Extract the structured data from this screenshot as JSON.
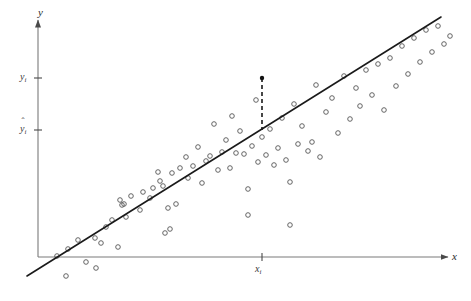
{
  "figure": {
    "type": "scatter-regression-diagram",
    "background_color": "#ffffff",
    "width": 471,
    "height": 301
  },
  "axes": {
    "x_axis_name": "x",
    "y_axis_name": "y",
    "origin": {
      "x": 38,
      "y": 257
    },
    "x_axis_end": {
      "x": 448,
      "y": 257
    },
    "y_axis_end": {
      "x": 38,
      "y": 20
    },
    "axis_color": "#7a7a7a"
  },
  "ticks": {
    "y_observed": {
      "label": "y",
      "subscript": "i",
      "y_pixel": 78
    },
    "y_fitted": {
      "label": "y",
      "subscript": "i",
      "hat": "ˆ",
      "y_pixel": 130
    },
    "x_point": {
      "label": "x",
      "subscript": "i",
      "x_pixel": 262
    }
  },
  "regression_line": {
    "color": "#1a1a1a",
    "x1": 27,
    "y1": 276,
    "x2": 441,
    "y2": 17,
    "width": 1.6
  },
  "residual_line": {
    "style": "dashed",
    "color": "#1a1a1a",
    "x": 262,
    "y_top": 78,
    "y_bottom": 130
  },
  "highlight_point": {
    "x": 262,
    "y": 78,
    "filled": true,
    "radius": 2.2,
    "color": "#111111"
  },
  "chart_data": {
    "type": "scatter",
    "title": "",
    "xlabel": "x",
    "ylabel": "y",
    "grid": false,
    "legend": null,
    "marker": "open-circle",
    "marker_color": "#555555",
    "points": [
      [
        57,
        256
      ],
      [
        66,
        276
      ],
      [
        68,
        249
      ],
      [
        78,
        240
      ],
      [
        86,
        262
      ],
      [
        96,
        268
      ],
      [
        101,
        243
      ],
      [
        106,
        227
      ],
      [
        112,
        220
      ],
      [
        120,
        200
      ],
      [
        122,
        205
      ],
      [
        124,
        204
      ],
      [
        126,
        217
      ],
      [
        131,
        196
      ],
      [
        140,
        210
      ],
      [
        143,
        192
      ],
      [
        150,
        198
      ],
      [
        153,
        188
      ],
      [
        158,
        172
      ],
      [
        160,
        181
      ],
      [
        163,
        186
      ],
      [
        168,
        208
      ],
      [
        172,
        173
      ],
      [
        176,
        204
      ],
      [
        180,
        168
      ],
      [
        186,
        157
      ],
      [
        188,
        178
      ],
      [
        193,
        166
      ],
      [
        198,
        147
      ],
      [
        202,
        183
      ],
      [
        206,
        161
      ],
      [
        210,
        156
      ],
      [
        214,
        124
      ],
      [
        218,
        170
      ],
      [
        222,
        152
      ],
      [
        226,
        140
      ],
      [
        230,
        168
      ],
      [
        232,
        116
      ],
      [
        236,
        153
      ],
      [
        240,
        131
      ],
      [
        244,
        154
      ],
      [
        248,
        189
      ],
      [
        252,
        146
      ],
      [
        256,
        100
      ],
      [
        258,
        162
      ],
      [
        262,
        137
      ],
      [
        266,
        155
      ],
      [
        270,
        129
      ],
      [
        274,
        165
      ],
      [
        278,
        148
      ],
      [
        282,
        118
      ],
      [
        286,
        160
      ],
      [
        290,
        182
      ],
      [
        294,
        104
      ],
      [
        298,
        144
      ],
      [
        302,
        126
      ],
      [
        308,
        151
      ],
      [
        312,
        142
      ],
      [
        316,
        85
      ],
      [
        320,
        157
      ],
      [
        326,
        112
      ],
      [
        332,
        98
      ],
      [
        338,
        133
      ],
      [
        344,
        76
      ],
      [
        350,
        119
      ],
      [
        356,
        88
      ],
      [
        360,
        106
      ],
      [
        366,
        70
      ],
      [
        372,
        95
      ],
      [
        378,
        64
      ],
      [
        384,
        110
      ],
      [
        390,
        58
      ],
      [
        396,
        86
      ],
      [
        402,
        46
      ],
      [
        408,
        74
      ],
      [
        414,
        38
      ],
      [
        420,
        62
      ],
      [
        426,
        30
      ],
      [
        432,
        52
      ],
      [
        438,
        26
      ],
      [
        444,
        44
      ],
      [
        450,
        36
      ],
      [
        165,
        233
      ],
      [
        170,
        229
      ],
      [
        248,
        215
      ],
      [
        290,
        225
      ],
      [
        118,
        247
      ],
      [
        95,
        238
      ]
    ],
    "xlim": [
      0,
      471
    ],
    "ylim": [
      0,
      301
    ]
  }
}
